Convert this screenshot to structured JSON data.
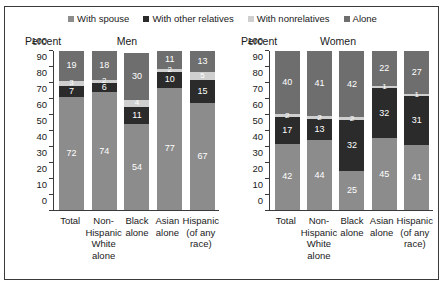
{
  "legend": {
    "items": [
      {
        "label": "With spouse",
        "color": "#8c8c8c",
        "key": "with_spouse"
      },
      {
        "label": "With other relatives",
        "color": "#2b2b2b",
        "key": "with_other_relatives"
      },
      {
        "label": "With nonrelatives",
        "color": "#cfcfcf",
        "key": "with_nonrelatives"
      },
      {
        "label": "Alone",
        "color": "#6e6e6e",
        "key": "alone"
      }
    ]
  },
  "axis_title": "Percent",
  "panels": [
    {
      "name": "men",
      "title": "Men"
    },
    {
      "name": "women",
      "title": "Women"
    }
  ],
  "chart_data": [
    {
      "type": "bar",
      "title": "Men",
      "xlabel": "",
      "ylabel": "Percent",
      "ylim": [
        0,
        100
      ],
      "yticks": [
        0,
        10,
        20,
        30,
        40,
        50,
        60,
        70,
        80,
        90,
        100
      ],
      "stacked": true,
      "grid": false,
      "legend_position": "top-center",
      "categories": [
        "Total",
        "Non-Hispanic White alone",
        "Black alone",
        "Asian alone",
        "Hispanic (of any race)"
      ],
      "category_lines": [
        [
          "Total"
        ],
        [
          "Non-",
          "Hispanic",
          "White",
          "alone"
        ],
        [
          "Black",
          "alone"
        ],
        [
          "Asian",
          "alone"
        ],
        [
          "Hispanic",
          "(of any",
          "race)"
        ]
      ],
      "series": [
        {
          "name": "With spouse",
          "color": "#8c8c8c",
          "values": [
            72,
            74,
            54,
            77,
            67
          ]
        },
        {
          "name": "With other relatives",
          "color": "#2b2b2b",
          "values": [
            7,
            6,
            11,
            10,
            15
          ]
        },
        {
          "name": "With nonrelatives",
          "color": "#cfcfcf",
          "values": [
            3,
            2,
            4,
            2,
            5
          ]
        },
        {
          "name": "Alone",
          "color": "#6e6e6e",
          "values": [
            19,
            18,
            30,
            11,
            13
          ]
        }
      ]
    },
    {
      "type": "bar",
      "title": "Women",
      "xlabel": "",
      "ylabel": "Percent",
      "ylim": [
        0,
        100
      ],
      "yticks": [
        0,
        10,
        20,
        30,
        40,
        50,
        60,
        70,
        80,
        90,
        100
      ],
      "stacked": true,
      "grid": false,
      "legend_position": "top-center",
      "categories": [
        "Total",
        "Non-Hispanic White alone",
        "Black alone",
        "Asian alone",
        "Hispanic (of any race)"
      ],
      "category_lines": [
        [
          "Total"
        ],
        [
          "Non-",
          "Hispanic",
          "White",
          "alone"
        ],
        [
          "Black",
          "alone"
        ],
        [
          "Asian",
          "alone"
        ],
        [
          "Hispanic",
          "(of any",
          "race)"
        ]
      ],
      "series": [
        {
          "name": "With spouse",
          "color": "#8c8c8c",
          "values": [
            42,
            44,
            25,
            45,
            41
          ]
        },
        {
          "name": "With other relatives",
          "color": "#2b2b2b",
          "values": [
            17,
            13,
            32,
            32,
            31
          ]
        },
        {
          "name": "With nonrelatives",
          "color": "#cfcfcf",
          "values": [
            2,
            2,
            2,
            1,
            1
          ]
        },
        {
          "name": "Alone",
          "color": "#6e6e6e",
          "values": [
            40,
            41,
            42,
            22,
            27
          ]
        }
      ]
    }
  ]
}
